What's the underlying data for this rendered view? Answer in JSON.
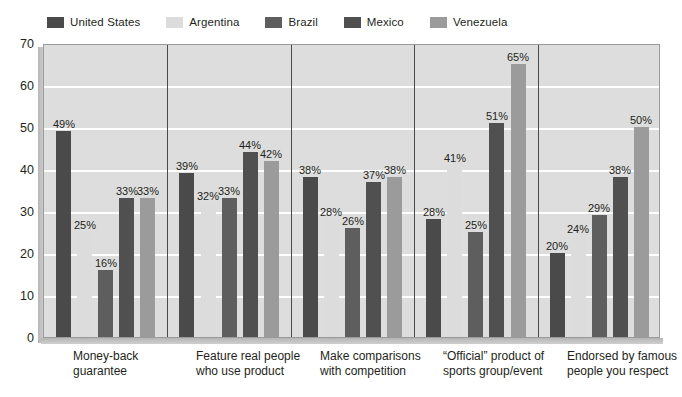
{
  "legend": {
    "items": [
      {
        "label": "United States",
        "color": "#4a4a4a"
      },
      {
        "label": "Argentina",
        "color": "#dcdcdc"
      },
      {
        "label": "Brazil",
        "color": "#5e5e5e"
      },
      {
        "label": "Mexico",
        "color": "#505050"
      },
      {
        "label": "Venezuela",
        "color": "#9b9b9b"
      }
    ]
  },
  "axis": {
    "y_ticks": [
      "0",
      "10",
      "20",
      "30",
      "40",
      "50",
      "60",
      "70"
    ]
  },
  "chart_data": {
    "type": "bar",
    "title": "",
    "subtitle": "",
    "xlabel": "",
    "ylabel": "",
    "ylim": [
      0,
      70
    ],
    "ytick_step": 10,
    "grid": true,
    "legend_position": "top-left",
    "value_suffix": "%",
    "categories": [
      "Money-back\nguarantee",
      "Feature real people\nwho use product",
      "Make comparisons\nwith competition",
      "“Official” product of\nsports group/event",
      "Endorsed by famous\npeople you respect"
    ],
    "series": [
      {
        "name": "United States",
        "color": "#4a4a4a",
        "values": [
          49,
          39,
          38,
          28,
          20
        ]
      },
      {
        "name": "Argentina",
        "color": "#dcdcdc",
        "values": [
          25,
          32,
          28,
          41,
          24
        ]
      },
      {
        "name": "Brazil",
        "color": "#5e5e5e",
        "values": [
          16,
          33,
          26,
          25,
          29
        ]
      },
      {
        "name": "Mexico",
        "color": "#505050",
        "values": [
          33,
          44,
          37,
          51,
          38
        ]
      },
      {
        "name": "Venezuela",
        "color": "#9b9b9b",
        "values": [
          33,
          42,
          38,
          65,
          50
        ]
      }
    ],
    "data_labels": [
      [
        "49%",
        "25%",
        "16%",
        "33%",
        "33%"
      ],
      [
        "39%",
        "32%",
        "33%",
        "44%",
        "42%"
      ],
      [
        "38%",
        "28%",
        "26%",
        "37%",
        "38%"
      ],
      [
        "28%",
        "41%",
        "25%",
        "51%",
        "65%"
      ],
      [
        "20%",
        "24%",
        "29%",
        "38%",
        "50%"
      ]
    ],
    "colors": {
      "plot_background": "#dddddd",
      "gridline": "#ffffff",
      "separator": "#4a4a4a",
      "text": "#231f20"
    }
  }
}
